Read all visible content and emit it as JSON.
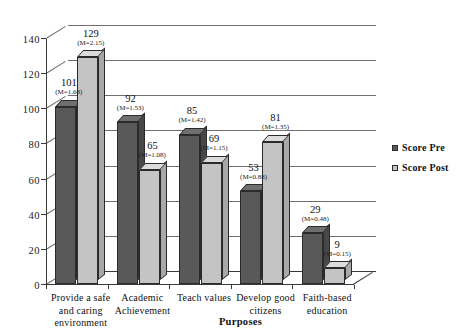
{
  "chart_data": {
    "type": "bar",
    "title": "",
    "xlabel": "Purposes",
    "ylabel": "",
    "ylim": [
      0,
      140
    ],
    "yticks": [
      0,
      20,
      40,
      60,
      80,
      100,
      120,
      140
    ],
    "grid": true,
    "legend_position": "right",
    "categories": [
      "Provide a safe and caring environment",
      "Academic Achievement",
      "Teach values",
      "Develop good citizens",
      "Faith-based education"
    ],
    "category_lines": [
      [
        "Provide a safe",
        "and caring",
        "environment"
      ],
      [
        "Academic",
        "Achievement"
      ],
      [
        "Teach values"
      ],
      [
        "Develop good",
        "citizens"
      ],
      [
        "Faith-based",
        "education"
      ]
    ],
    "series": [
      {
        "name": "Score Pre",
        "color": "#595959",
        "values": [
          101,
          92,
          85,
          53,
          29
        ],
        "annotations": [
          "(M=1.68)",
          "(M=1.53)",
          "(M=1.42)",
          "(M=0.88)",
          "(M=0.48)"
        ]
      },
      {
        "name": "Score Post",
        "color": "#c4c4c4",
        "values": [
          129,
          65,
          69,
          81,
          9
        ],
        "annotations": [
          "(M=2.15)",
          "(M=1.08)",
          "(M=1.15)",
          "(M=1.35)",
          "(M=0.15)"
        ]
      }
    ]
  },
  "legend": {
    "items": [
      {
        "label": "Score Pre",
        "color": "#595959"
      },
      {
        "label": "Score Post",
        "color": "#c4c4c4"
      }
    ]
  }
}
